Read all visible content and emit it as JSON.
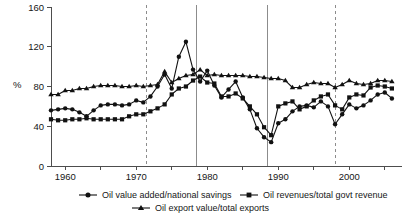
{
  "chart_data": {
    "type": "line",
    "title": "",
    "xlabel": "",
    "ylabel": "%",
    "ylim": [
      0,
      160
    ],
    "xlim": [
      1958,
      2007
    ],
    "yticks": [
      0,
      40,
      80,
      120,
      160
    ],
    "ytick_labels": [
      "0",
      "40",
      "80",
      "120",
      "160"
    ],
    "xticks": [
      1960,
      1965,
      1970,
      1975,
      1980,
      1985,
      1990,
      1995,
      2000,
      2005
    ],
    "xtick_labels": [
      "1960",
      "",
      "1970",
      "",
      "1980",
      "",
      "1990",
      "",
      "2000",
      ""
    ],
    "grid": false,
    "legend_position": "bottom",
    "x": [
      1958,
      1959,
      1960,
      1961,
      1962,
      1963,
      1964,
      1965,
      1966,
      1967,
      1968,
      1969,
      1970,
      1971,
      1972,
      1973,
      1974,
      1975,
      1976,
      1977,
      1978,
      1979,
      1980,
      1981,
      1982,
      1983,
      1984,
      1985,
      1986,
      1987,
      1988,
      1989,
      1990,
      1991,
      1992,
      1993,
      1994,
      1995,
      1996,
      1997,
      1998,
      1999,
      2000,
      2001,
      2002,
      2003,
      2004,
      2005,
      2006
    ],
    "series": [
      {
        "name": "Oil value added/national savings",
        "marker": "circle",
        "values": [
          56,
          57,
          58,
          57,
          54,
          50,
          56,
          61,
          62,
          62,
          61,
          62,
          66,
          64,
          70,
          80,
          92,
          78,
          110,
          125,
          97,
          85,
          96,
          81,
          69,
          77,
          85,
          69,
          57,
          38,
          29,
          24,
          43,
          47,
          55,
          60,
          61,
          59,
          65,
          60,
          42,
          52,
          62,
          58,
          61,
          66,
          72,
          74,
          68
        ]
      },
      {
        "name": "Oil revenues/total govt revenue",
        "marker": "square",
        "values": [
          47,
          46,
          46,
          47,
          47,
          48,
          47,
          47,
          47,
          47,
          47,
          50,
          52,
          52,
          55,
          58,
          62,
          72,
          78,
          80,
          86,
          90,
          84,
          83,
          70,
          70,
          73,
          68,
          60,
          52,
          39,
          31,
          60,
          63,
          65,
          57,
          60,
          66,
          70,
          72,
          61,
          57,
          69,
          72,
          71,
          79,
          81,
          80,
          78
        ]
      },
      {
        "name": "Oil export value/total exports",
        "marker": "triangle",
        "values": [
          72,
          72,
          76,
          76,
          78,
          78,
          80,
          81,
          81,
          81,
          80,
          80,
          81,
          80,
          81,
          82,
          95,
          84,
          88,
          91,
          92,
          97,
          91,
          92,
          91,
          91,
          91,
          91,
          90,
          90,
          89,
          88,
          88,
          86,
          79,
          79,
          82,
          84,
          83,
          83,
          79,
          82,
          86,
          83,
          82,
          83,
          86,
          86,
          85
        ]
      }
    ],
    "reference_lines": [
      {
        "x": 1971.5,
        "style": "dashed"
      },
      {
        "x": 1978.5,
        "style": "solid"
      },
      {
        "x": 1988.5,
        "style": "solid"
      },
      {
        "x": 1998.0,
        "style": "dashed"
      }
    ],
    "legend": [
      {
        "label": "Oil value added/national savings",
        "marker": "circle"
      },
      {
        "label": "Oil revenues/total govt revenue",
        "marker": "square"
      },
      {
        "label": "Oil export value/total exports",
        "marker": "triangle"
      }
    ]
  }
}
